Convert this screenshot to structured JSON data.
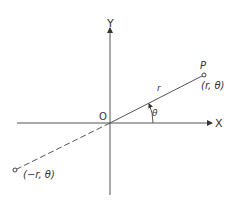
{
  "diagram": {
    "type": "polar-coordinates",
    "axes": {
      "x_label": "X",
      "y_label": "Y",
      "origin_label": "O"
    },
    "points": [
      {
        "name": "P",
        "label": "P",
        "coords_label": "(r, θ)"
      },
      {
        "name": "negative-r-point",
        "coords_label": "(−r, θ)"
      }
    ],
    "ray_label": "r",
    "angle_label": "θ",
    "colors": {
      "line": "#555555",
      "text": "#333333",
      "background": "#ffffff"
    }
  }
}
